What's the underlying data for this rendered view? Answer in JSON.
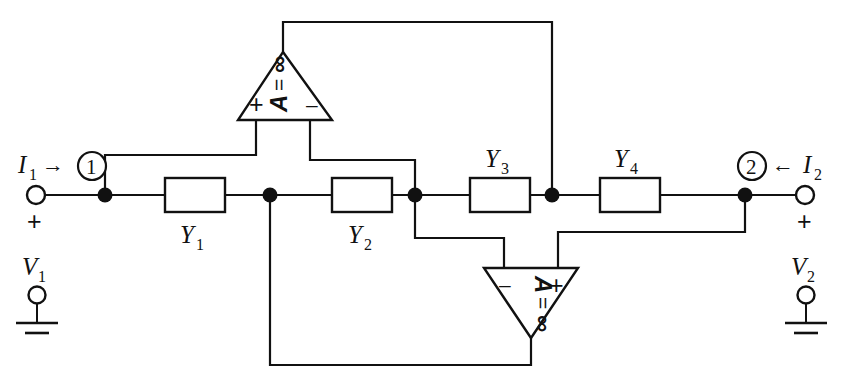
{
  "figure": {
    "kind": "circuit-schematic",
    "width": 853,
    "height": 387,
    "background_color": "#ffffff",
    "line_color": "#111111"
  },
  "ports": {
    "left": {
      "current_label": "I",
      "current_sub": "1",
      "current_arrow": "→",
      "node_number": "1",
      "plus_sign": "+",
      "minus_sign": "–",
      "voltage_label": "V",
      "voltage_sub": "1"
    },
    "right": {
      "current_label": "I",
      "current_sub": "2",
      "current_arrow": "←",
      "node_number": "2",
      "plus_sign": "+",
      "minus_sign": "–",
      "voltage_label": "V",
      "voltage_sub": "2"
    }
  },
  "admittances": [
    {
      "id": "y1",
      "label": "Y",
      "sub": "1",
      "label_position": "below"
    },
    {
      "id": "y2",
      "label": "Y",
      "sub": "2",
      "label_position": "below"
    },
    {
      "id": "y3",
      "label": "Y",
      "sub": "3",
      "label_position": "above"
    },
    {
      "id": "y4",
      "label": "Y",
      "sub": "4",
      "label_position": "above"
    }
  ],
  "amplifiers": [
    {
      "id": "amp-top",
      "orientation": "up",
      "gain_symbol": "A",
      "gain_equals": "=",
      "gain_value": "∞",
      "left_input_sign": "+",
      "right_input_sign": "–"
    },
    {
      "id": "amp-bottom",
      "orientation": "down",
      "gain_symbol": "A",
      "gain_equals": "=",
      "gain_value": "∞",
      "left_input_sign": "–",
      "right_input_sign": "+"
    }
  ],
  "ground_symbols": [
    {
      "id": "gnd-left",
      "side": "left"
    },
    {
      "id": "gnd-right",
      "side": "right"
    }
  ]
}
